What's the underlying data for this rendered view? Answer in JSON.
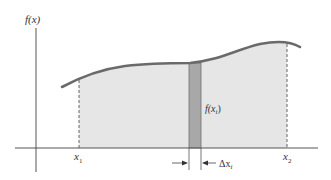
{
  "labels": {
    "y_axis": "f(x)",
    "x1": "x",
    "x1_sub": "1",
    "x2": "x",
    "x2_sub": "2",
    "strip_height": "f(x",
    "strip_height_sub": "i",
    "strip_height_close": ")",
    "strip_width": "Δx",
    "strip_width_sub": "i"
  },
  "colors": {
    "curve": "#6a6a6a",
    "fill": "#e6e6e6",
    "strip": "#a8a8a8",
    "axis": "#555555",
    "text": "#333333"
  }
}
